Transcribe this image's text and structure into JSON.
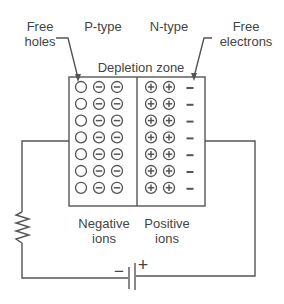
{
  "diagram": {
    "labels": {
      "free_holes": [
        "Free",
        "holes"
      ],
      "p_type": "P-type",
      "n_type": "N-type",
      "free_electrons": [
        "Free",
        "electrons"
      ],
      "depletion_zone": "Depletion zone",
      "negative_ions": [
        "Negative",
        "ions"
      ],
      "positive_ions": [
        "Positive",
        "ions"
      ],
      "battery_minus": "−",
      "battery_plus": "+"
    },
    "rows": 7,
    "p_side_row": [
      "hole",
      "negative-ion",
      "negative-ion"
    ],
    "n_side_row": [
      "positive-ion",
      "positive-ion",
      "free-electron"
    ],
    "colors": {
      "line": "#555555",
      "text": "#444444",
      "background": "#ffffff"
    }
  }
}
